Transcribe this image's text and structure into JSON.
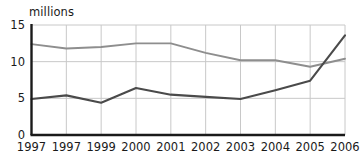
{
  "chart_data": {
    "type": "line",
    "title": "",
    "subtitle": "",
    "xlabel": "",
    "ylabel": "millions",
    "ylim": [
      0,
      15
    ],
    "yticks": [
      0,
      5,
      10,
      15
    ],
    "ytick_labels": [
      "0",
      "5",
      "10",
      "15"
    ],
    "grid": true,
    "grid_axis": "both",
    "legend": "none",
    "categories": [
      "1997",
      "1997",
      "1999",
      "2000",
      "2001",
      "2002",
      "2003",
      "2004",
      "2005",
      "2006"
    ],
    "series": [
      {
        "name": "upper-series",
        "color": "#8e8e8e",
        "values": [
          12.4,
          11.8,
          12.0,
          12.5,
          12.5,
          11.2,
          10.2,
          10.2,
          9.3,
          10.4
        ]
      },
      {
        "name": "lower-series",
        "color": "#4a4a4a",
        "values": [
          4.9,
          5.4,
          4.4,
          6.4,
          5.5,
          5.2,
          4.9,
          6.1,
          7.4,
          13.6
        ]
      }
    ],
    "annotations": []
  },
  "axis": {
    "unit_label": "millions",
    "colors": {
      "axis_line": "#1a1a1a",
      "grid_line": "#c8c8c8",
      "text": "#1a1a1a",
      "background": "#ffffff"
    }
  }
}
